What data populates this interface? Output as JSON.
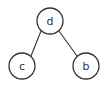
{
  "diagram": {
    "type": "binary-tree",
    "nodes": [
      {
        "id": "d",
        "label": "d",
        "cx": 50,
        "cy": 21,
        "r": 13
      },
      {
        "id": "c",
        "label": "c",
        "cx": 22,
        "cy": 66,
        "r": 13
      },
      {
        "id": "b",
        "label": "b",
        "cx": 86,
        "cy": 66,
        "r": 13
      }
    ],
    "edges": [
      {
        "from": "d",
        "to": "c"
      },
      {
        "from": "d",
        "to": "b"
      }
    ],
    "colors": {
      "stroke": "#333333",
      "fill": "#ffffff",
      "background": "#ffffff"
    }
  }
}
